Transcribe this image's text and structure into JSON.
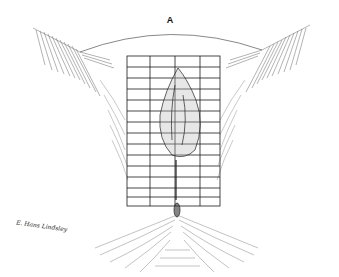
{
  "figure": {
    "panel_label": "A",
    "signature": "E. Hans Lindsley",
    "grid": {
      "x": 127,
      "y": 56,
      "width": 93,
      "height": 150,
      "columns": [
        127,
        150,
        163,
        175,
        188,
        200,
        220
      ],
      "row_count": 14
    },
    "colors": {
      "ink": "#1a1a1a",
      "hatch": "#555555",
      "background": "#ffffff"
    }
  }
}
